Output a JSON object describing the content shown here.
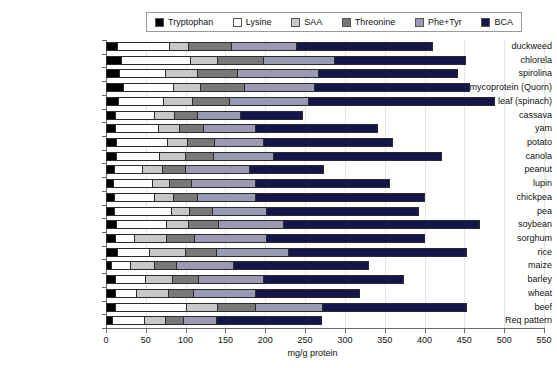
{
  "legend": {
    "position": "top-center",
    "entries": [
      {
        "label": "Tryptophan",
        "color": "#000000"
      },
      {
        "label": "Lysine",
        "color": "#ffffff"
      },
      {
        "label": "SAA",
        "color": "#c8c8c8"
      },
      {
        "label": "Threonine",
        "color": "#787878"
      },
      {
        "label": "Phe+Tyr",
        "color": "#9a9ab4"
      },
      {
        "label": "BCA",
        "color": "#14164a"
      }
    ]
  },
  "chart_data": {
    "type": "bar",
    "orientation": "horizontal",
    "stacked": true,
    "title": "",
    "xlabel": "mg/g protein",
    "ylabel": "",
    "xlim": [
      0,
      550
    ],
    "xticks": [
      0,
      50,
      100,
      150,
      200,
      250,
      300,
      350,
      400,
      450,
      500,
      550
    ],
    "grid": true,
    "legend_position": "top",
    "categories": [
      "duckweed",
      "chlorela",
      "spirolina",
      "mycoprotein (Quorn)",
      "leaf (spinach)",
      "cassava",
      "yam",
      "potato",
      "canola",
      "peanut",
      "lupin",
      "chickpea",
      "pea",
      "soybean",
      "sorghum",
      "rice",
      "maize",
      "barley",
      "wheat",
      "beef",
      "Req pattern"
    ],
    "series": [
      {
        "name": "Tryptophan",
        "color": "#000000",
        "values": [
          15,
          20,
          18,
          22,
          16,
          12,
          12,
          14,
          14,
          11,
          10,
          11,
          11,
          14,
          12,
          15,
          8,
          13,
          12,
          13,
          9
        ]
      },
      {
        "name": "Lysine",
        "color": "#ffffff",
        "values": [
          65,
          87,
          57,
          64,
          57,
          50,
          54,
          64,
          54,
          35,
          49,
          50,
          72,
          62,
          25,
          40,
          23,
          37,
          27,
          89,
          40
        ]
      },
      {
        "name": "SAA",
        "color": "#c8c8c8",
        "values": [
          24,
          34,
          41,
          33,
          36,
          25,
          27,
          25,
          33,
          25,
          22,
          25,
          23,
          28,
          40,
          45,
          30,
          34,
          40,
          39,
          26
        ]
      },
      {
        "name": "Threonine",
        "color": "#787878",
        "values": [
          54,
          57,
          50,
          55,
          47,
          28,
          30,
          34,
          35,
          30,
          27,
          30,
          29,
          38,
          35,
          39,
          28,
          33,
          32,
          47,
          23
        ]
      },
      {
        "name": "Phe+Tyr",
        "color": "#9a9ab4",
        "values": [
          82,
          90,
          102,
          88,
          99,
          55,
          65,
          62,
          75,
          80,
          80,
          72,
          67,
          82,
          90,
          91,
          72,
          81,
          77,
          84,
          42
        ]
      },
      {
        "name": "BCA",
        "color": "#14164a",
        "values": [
          171,
          164,
          174,
          195,
          234,
          78,
          154,
          161,
          211,
          93,
          169,
          212,
          191,
          246,
          199,
          223,
          169,
          176,
          131,
          181,
          131
        ]
      }
    ],
    "totals": [
      411,
      452,
      442,
      457,
      489,
      248,
      342,
      360,
      422,
      274,
      357,
      400,
      393,
      470,
      401,
      453,
      330,
      374,
      319,
      453,
      271
    ]
  }
}
